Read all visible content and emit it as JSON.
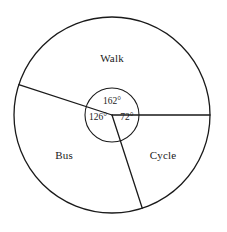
{
  "chart_data": {
    "type": "pie",
    "title": "",
    "subtitle": "",
    "xlabel": "",
    "ylabel": "",
    "categories": [
      "Walk",
      "Cycle",
      "Bus"
    ],
    "values": [
      162,
      72,
      126
    ],
    "value_unit": "degrees",
    "data_labels": [
      "162°",
      "72°",
      "126°"
    ],
    "legend_position": "none",
    "grid": false,
    "annotations": [
      "Pie chart divided into three sectors with central angles marked",
      "Angles sum to 360 degrees"
    ],
    "slices": [
      {
        "name": "Walk",
        "angle": 162,
        "angle_label": "162°",
        "start_angle_deg": 0,
        "end_angle_deg": 162,
        "fill": "#ffffff",
        "stroke": "#1a1a1a"
      },
      {
        "name": "Bus",
        "angle": 126,
        "angle_label": "126°",
        "start_angle_deg": 162,
        "end_angle_deg": 288,
        "fill": "#ffffff",
        "stroke": "#1a1a1a"
      },
      {
        "name": "Cycle",
        "angle": 72,
        "angle_label": "72°",
        "start_angle_deg": 288,
        "end_angle_deg": 360,
        "fill": "#ffffff",
        "stroke": "#1a1a1a"
      }
    ]
  },
  "figure": {
    "outer_circle": {
      "center_x": 112,
      "center_y": 115,
      "radius": 98
    },
    "inner_circle": {
      "center_x": 112,
      "center_y": 115,
      "radius": 27
    },
    "stroke_color": "#1a1a1a",
    "fill_color": "#ffffff",
    "background": "#ffffff"
  },
  "labels": {
    "walk": {
      "text": "Walk",
      "x": 112,
      "y": 58
    },
    "bus": {
      "text": "Bus",
      "x": 64,
      "y": 155
    },
    "cycle": {
      "text": "Cycle",
      "x": 163,
      "y": 155
    },
    "angle_walk": {
      "text": "162°",
      "x": 112,
      "y": 101
    },
    "angle_bus": {
      "text": "126°",
      "x": 98,
      "y": 117
    },
    "angle_cycle": {
      "text": "72°",
      "x": 127,
      "y": 117
    }
  }
}
